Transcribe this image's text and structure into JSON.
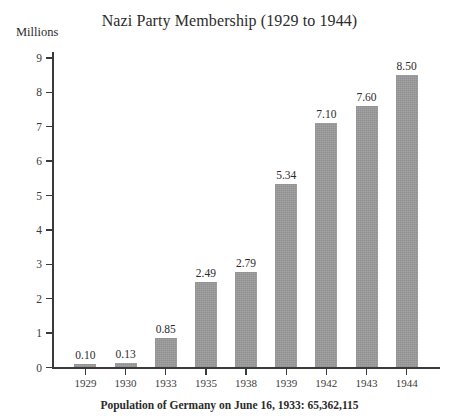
{
  "chart_data": {
    "type": "bar",
    "title": "Nazi Party Membership (1929 to 1944)",
    "subtitle": "",
    "xlabel": "",
    "ylabel": "Millions",
    "categories": [
      "1929",
      "1930",
      "1933",
      "1935",
      "1938",
      "1939",
      "1942",
      "1943",
      "1944"
    ],
    "values": [
      0.1,
      0.13,
      0.85,
      2.49,
      2.79,
      5.34,
      7.1,
      7.6,
      8.5
    ],
    "value_labels": [
      "0.10",
      "0.13",
      "0.85",
      "2.49",
      "2.79",
      "5.34",
      "7.10",
      "7.60",
      "8.50"
    ],
    "ylim": [
      0,
      9
    ],
    "ytick_labels": [
      "0",
      "1",
      "2",
      "3",
      "4",
      "5",
      "6",
      "7",
      "8",
      "9"
    ],
    "ytick_values": [
      0,
      1,
      2,
      3,
      4,
      5,
      6,
      7,
      8,
      9
    ],
    "grid": false,
    "legend": false,
    "legend_position": "none",
    "bar_color": "#9c9c9c",
    "axis_color": "#3a3a3a",
    "text_color": "#2b2b2b",
    "background_color": "#ffffff",
    "annotations": [
      "Population of Germany on June 16, 1933: 65,362,115"
    ]
  },
  "footer": {
    "caption": "Population of Germany on June 16, 1933: 65,362,115"
  }
}
